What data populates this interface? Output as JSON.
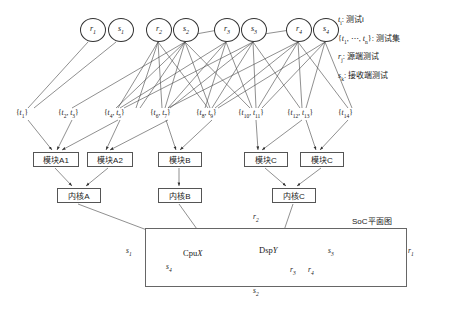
{
  "diagram": {
    "title_soc": "SoC平面图",
    "source_nodes": [
      {
        "id": "r1",
        "sym": "r",
        "sub": "1",
        "x": 80,
        "y": 18
      },
      {
        "id": "s1",
        "sym": "s",
        "sub": "1",
        "x": 108,
        "y": 18
      },
      {
        "id": "r2",
        "sym": "r",
        "sub": "2",
        "x": 150,
        "y": 18
      },
      {
        "id": "s2",
        "sym": "s",
        "sub": "2",
        "x": 177,
        "y": 18
      },
      {
        "id": "r3",
        "sym": "r",
        "sub": "3",
        "x": 218,
        "y": 18
      },
      {
        "id": "s3",
        "sym": "s",
        "sub": "3",
        "x": 245,
        "y": 18
      },
      {
        "id": "r4",
        "sym": "r",
        "sub": "4",
        "x": 290,
        "y": 18
      },
      {
        "id": "s4",
        "sym": "s",
        "sub": "4",
        "x": 317,
        "y": 18
      }
    ],
    "test_sets": [
      {
        "label": "{t1}",
        "html": "{<i>t</i><sub>1</sub>}",
        "x": 18,
        "y": 110
      },
      {
        "label": "{t2, t3}",
        "html": "{<i>t</i><sub>2</sub>, <i>t</i><sub>3</sub>}",
        "x": 60,
        "y": 110
      },
      {
        "label": "{t4, t5}",
        "html": "{<i>t</i><sub>4</sub>, <i>t</i><sub>5</sub>}",
        "x": 104,
        "y": 110
      },
      {
        "label": "{t6, t7}",
        "html": "{<i>t</i><sub>6</sub>, <i>t</i><sub>7</sub>}",
        "x": 150,
        "y": 110
      },
      {
        "label": "{t8, t9}",
        "html": "{<i>t</i><sub>8</sub>, <i>t</i><sub>9</sub>}",
        "x": 196,
        "y": 110
      },
      {
        "label": "{t10, t11}",
        "html": "{<i>t</i><sub>10</sub>, <i>t</i><sub>11</sub>}",
        "x": 240,
        "y": 110
      },
      {
        "label": "{t12, t13}",
        "html": "{<i>t</i><sub>12</sub>, <i>t</i><sub>13</sub>}",
        "x": 289,
        "y": 110
      },
      {
        "label": "{t14}",
        "html": "{<i>t</i><sub>14</sub>}",
        "x": 340,
        "y": 110
      }
    ],
    "modules": [
      {
        "label": "模块A1",
        "x": 33,
        "y": 154,
        "w": 44
      },
      {
        "label": "模块A2",
        "x": 87,
        "y": 154,
        "w": 44
      },
      {
        "label": "模块B",
        "x": 158,
        "y": 154,
        "w": 42
      },
      {
        "label": "模块C",
        "x": 244,
        "y": 154,
        "w": 42
      },
      {
        "label": "模块C",
        "x": 300,
        "y": 154,
        "w": 42
      }
    ],
    "kernels": [
      {
        "label": "内核A",
        "x": 57,
        "y": 190,
        "w": 42
      },
      {
        "label": "内核B",
        "x": 158,
        "y": 190,
        "w": 42
      },
      {
        "label": "内核C",
        "x": 272,
        "y": 190,
        "w": 42
      }
    ],
    "soc": {
      "x": 145,
      "y": 228,
      "w": 260,
      "h": 57,
      "units": [
        {
          "label": "CpuX",
          "name": "Cpu",
          "var": "X",
          "x": 185,
          "y": 248
        },
        {
          "label": "DspY",
          "name": "Dsp",
          "var": "Y",
          "x": 263,
          "y": 246
        }
      ]
    },
    "edge_labels": [
      {
        "sym": "r",
        "sub": "2",
        "x": 253,
        "y": 215
      },
      {
        "sym": "r",
        "sub": "1",
        "x": 408,
        "y": 249
      },
      {
        "sym": "r",
        "sub": "3",
        "x": 290,
        "y": 268
      },
      {
        "sym": "r",
        "sub": "4",
        "x": 308,
        "y": 268
      },
      {
        "sym": "s",
        "sub": "1",
        "x": 126,
        "y": 248
      },
      {
        "sym": "s",
        "sub": "2",
        "x": 253,
        "y": 288
      },
      {
        "sym": "s",
        "sub": "3",
        "x": 328,
        "y": 249
      },
      {
        "sym": "s",
        "sub": "4",
        "x": 166,
        "y": 265
      }
    ]
  },
  "legend": {
    "rows": [
      {
        "symbol_html": "<span class=\"sym\">t</span><sub>i</sub>:",
        "text": "测试i",
        "plain": "t_i: 测试i"
      },
      {
        "symbol_html": "{<span class=\"sym\">t</span><sub>1</sub>, &#8943;, <span class=\"sym\">t</span><sub>n</sub>}:",
        "text": "测试集",
        "plain": "{t_1, ..., t_n}: 测试集"
      },
      {
        "symbol_html": "<span class=\"sym\">r</span><sub>j</sub>:",
        "text": "源端测试",
        "plain": "r_j: 源端测试"
      },
      {
        "symbol_html": "<span class=\"sym\">s</span><sub>k</sub>:",
        "text": "接收端测试",
        "plain": "s_k: 接收端测试"
      }
    ]
  },
  "colors": {
    "stroke": "#333333",
    "box_border": "#555555",
    "background": "#ffffff",
    "text": "#1a1a1a"
  }
}
